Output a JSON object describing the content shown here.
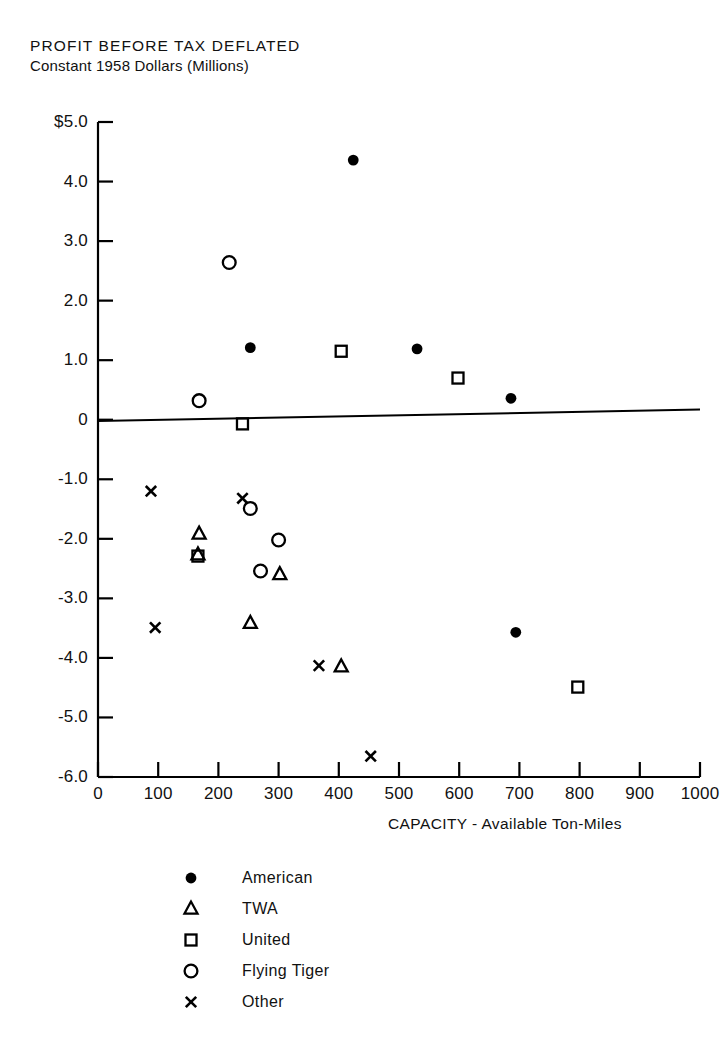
{
  "chart_data": {
    "type": "scatter",
    "title": "PROFIT BEFORE TAX DEFLATED",
    "subtitle": "Constant 1958 Dollars (Millions)",
    "xlabel": "CAPACITY - Available Ton-Miles",
    "ylabel": "",
    "xlim": [
      0,
      1000
    ],
    "ylim": [
      -6.0,
      5.0
    ],
    "grid": false,
    "legend_position": "below-plot-center",
    "xticks": [
      {
        "value": 0,
        "label": "0"
      },
      {
        "value": 100,
        "label": "100"
      },
      {
        "value": 200,
        "label": "200"
      },
      {
        "value": 300,
        "label": "300"
      },
      {
        "value": 400,
        "label": "400"
      },
      {
        "value": 500,
        "label": "500"
      },
      {
        "value": 600,
        "label": "600"
      },
      {
        "value": 700,
        "label": "700"
      },
      {
        "value": 800,
        "label": "800"
      },
      {
        "value": 900,
        "label": "900"
      },
      {
        "value": 1000,
        "label": "1000"
      }
    ],
    "yticks": [
      {
        "value": 5.0,
        "label": "$5.0"
      },
      {
        "value": 4.0,
        "label": "4.0"
      },
      {
        "value": 3.0,
        "label": "3.0"
      },
      {
        "value": 2.0,
        "label": "2.0"
      },
      {
        "value": 1.0,
        "label": "1.0"
      },
      {
        "value": 0.0,
        "label": "0"
      },
      {
        "value": -1.0,
        "label": "-1.0"
      },
      {
        "value": -2.0,
        "label": "-2.0"
      },
      {
        "value": -3.0,
        "label": "-3.0"
      },
      {
        "value": -4.0,
        "label": "-4.0"
      },
      {
        "value": -5.0,
        "label": "-5.0"
      },
      {
        "value": -6.0,
        "label": "-6.0"
      }
    ],
    "trend_line": {
      "name": "regression-line",
      "x_start": 0,
      "y_start": -0.02,
      "x_end": 1000,
      "y_end": 0.17
    },
    "series": [
      {
        "name": "American",
        "marker": "filled-circle",
        "color": "#000000",
        "points": [
          {
            "x": 424,
            "y": 4.36
          },
          {
            "x": 253,
            "y": 1.21
          },
          {
            "x": 530,
            "y": 1.19
          },
          {
            "x": 686,
            "y": 0.36
          },
          {
            "x": 694,
            "y": -3.57
          }
        ]
      },
      {
        "name": "TWA",
        "marker": "triangle",
        "color": "#000000",
        "points": [
          {
            "x": 168,
            "y": -1.92
          },
          {
            "x": 166,
            "y": -2.27
          },
          {
            "x": 302,
            "y": -2.6
          },
          {
            "x": 253,
            "y": -3.42
          },
          {
            "x": 404,
            "y": -4.15
          }
        ]
      },
      {
        "name": "United",
        "marker": "square",
        "color": "#000000",
        "points": [
          {
            "x": 404,
            "y": 1.15
          },
          {
            "x": 598,
            "y": 0.7
          },
          {
            "x": 240,
            "y": -0.07
          },
          {
            "x": 166,
            "y": -2.29
          },
          {
            "x": 797,
            "y": -4.49
          }
        ]
      },
      {
        "name": "Flying Tiger",
        "marker": "open-circle",
        "color": "#000000",
        "points": [
          {
            "x": 218,
            "y": 2.64
          },
          {
            "x": 168,
            "y": 0.32
          },
          {
            "x": 253,
            "y": -1.49
          },
          {
            "x": 300,
            "y": -2.02
          },
          {
            "x": 270,
            "y": -2.54
          }
        ]
      },
      {
        "name": "Other",
        "marker": "x",
        "color": "#000000",
        "points": [
          {
            "x": 88,
            "y": -1.2
          },
          {
            "x": 240,
            "y": -1.32
          },
          {
            "x": 95,
            "y": -3.49
          },
          {
            "x": 367,
            "y": -4.13
          },
          {
            "x": 453,
            "y": -5.65
          }
        ]
      }
    ]
  },
  "legend": {
    "items": [
      {
        "label": "American",
        "marker": "filled-circle"
      },
      {
        "label": "TWA",
        "marker": "triangle"
      },
      {
        "label": "United",
        "marker": "square"
      },
      {
        "label": "Flying Tiger",
        "marker": "open-circle"
      },
      {
        "label": "Other",
        "marker": "x"
      }
    ]
  }
}
